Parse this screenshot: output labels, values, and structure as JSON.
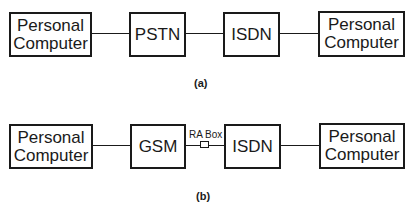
{
  "diagram_a": {
    "nodes": [
      {
        "id": "pc1",
        "label": "Personal\nComputer"
      },
      {
        "id": "pstn",
        "label": "PSTN"
      },
      {
        "id": "isdn",
        "label": "ISDN"
      },
      {
        "id": "pc2",
        "label": "Personal\nComputer"
      }
    ],
    "edges": [
      [
        "pc1",
        "pstn"
      ],
      [
        "pstn",
        "isdn"
      ],
      [
        "isdn",
        "pc2"
      ]
    ],
    "caption": "(a)"
  },
  "diagram_b": {
    "nodes": [
      {
        "id": "pc1",
        "label": "Personal\nComputer"
      },
      {
        "id": "gsm",
        "label": "GSM"
      },
      {
        "id": "ra_box",
        "label": "RA Box"
      },
      {
        "id": "isdn",
        "label": "ISDN"
      },
      {
        "id": "pc2",
        "label": "Personal\nComputer"
      }
    ],
    "edges": [
      [
        "pc1",
        "gsm"
      ],
      [
        "gsm",
        "ra_box"
      ],
      [
        "ra_box",
        "isdn"
      ],
      [
        "isdn",
        "pc2"
      ]
    ],
    "caption": "(b)"
  },
  "labels": {
    "pc_line1": "Personal",
    "pc_line2": "Computer",
    "pstn": "PSTN",
    "isdn": "ISDN",
    "gsm": "GSM",
    "ra_box": "RA Box",
    "caption_a": "(a)",
    "caption_b": "(b)"
  }
}
